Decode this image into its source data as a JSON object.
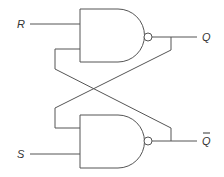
{
  "diagram": {
    "labels": {
      "input_r": "R",
      "input_s": "S",
      "output_q": "Q",
      "output_qbar": "Q",
      "qbar_overline": "‾"
    },
    "gates": [
      {
        "type": "NAND",
        "position": "top",
        "inputs": [
          "R",
          "Q̄ feedback"
        ],
        "output": "Q"
      },
      {
        "type": "NAND",
        "position": "bottom",
        "inputs": [
          "Q feedback",
          "S"
        ],
        "output": "Q̄"
      }
    ],
    "colors": {
      "line": "#555555",
      "text": "#333333",
      "background": "#ffffff"
    }
  }
}
